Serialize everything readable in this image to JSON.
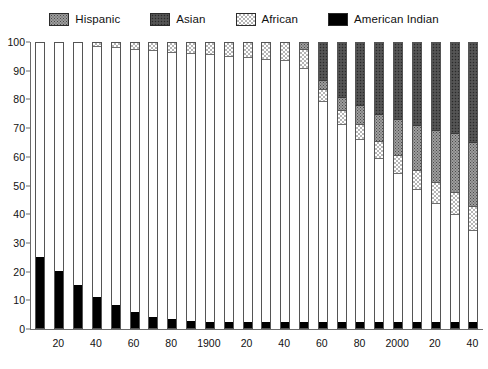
{
  "legend": {
    "items": [
      {
        "label": "Hispanic",
        "key": "hispanic",
        "color": "#9d9d9d",
        "pattern": "stipple-medium"
      },
      {
        "label": "Asian",
        "key": "asian",
        "color": "#4e4e4e",
        "pattern": "stipple-dark"
      },
      {
        "label": "African",
        "key": "african",
        "color": "#d8d8d8",
        "pattern": "checker-light"
      },
      {
        "label": "American Indian",
        "key": "amerindian",
        "color": "#000000",
        "pattern": "solid-black"
      }
    ]
  },
  "yaxis": {
    "ticks": [
      "100",
      "90",
      "80",
      "70",
      "60",
      "50",
      "40",
      "30",
      "20",
      "10",
      "0"
    ],
    "min": 0,
    "max": 100
  },
  "xaxis": {
    "labels": [
      "",
      "20",
      "",
      "40",
      "",
      "60",
      "",
      "80",
      "",
      "1900",
      "",
      "20",
      "",
      "40",
      "",
      "60",
      "",
      "80",
      "",
      "2000",
      "",
      "20",
      "",
      "40"
    ]
  },
  "chart_data": {
    "type": "bar",
    "title": "",
    "subtitle": "",
    "xlabel": "",
    "ylabel": "",
    "ylim": [
      0,
      100
    ],
    "grid": false,
    "stacked": true,
    "stack_order_bottom_to_top": [
      "amerindian",
      "white",
      "african",
      "hispanic",
      "asian"
    ],
    "legend_position": "top-center",
    "categories": [
      "1810",
      "1820",
      "1830",
      "1840",
      "1850",
      "1860",
      "1870",
      "1880",
      "1890",
      "1900",
      "1910",
      "1920",
      "1930",
      "1940",
      "1950",
      "1960",
      "1970",
      "1980",
      "1990",
      "2000",
      "2010",
      "2020",
      "2030",
      "2040"
    ],
    "x_tick_labels": [
      "",
      "20",
      "",
      "40",
      "",
      "60",
      "",
      "80",
      "",
      "1900",
      "",
      "20",
      "",
      "40",
      "",
      "60",
      "",
      "80",
      "",
      "2000",
      "",
      "20",
      "",
      "40"
    ],
    "series": [
      {
        "name": "American Indian",
        "key": "amerindian",
        "values": [
          25,
          20,
          15,
          11,
          8,
          5.5,
          4,
          3,
          2.5,
          2,
          2,
          2,
          2,
          2,
          2,
          2,
          2,
          2,
          2,
          2,
          2,
          2,
          2,
          2
        ]
      },
      {
        "name": "White / other",
        "key": "white",
        "values": [
          75,
          80,
          85,
          88,
          90.5,
          92.5,
          93.5,
          94,
          94,
          94,
          93.5,
          93,
          92.5,
          92,
          89.5,
          78,
          70,
          64.5,
          58,
          52.5,
          47,
          42,
          38,
          32.5
        ]
      },
      {
        "name": "African",
        "key": "african",
        "values": [
          0,
          0,
          0,
          1,
          1.5,
          2,
          2.5,
          3,
          3.5,
          4,
          4.5,
          5,
          5.5,
          6,
          6.5,
          4,
          4.5,
          5,
          5.5,
          6,
          6.5,
          7,
          7.5,
          8
        ]
      },
      {
        "name": "Hispanic",
        "key": "hispanic",
        "values": [
          0,
          0,
          0,
          0,
          0,
          0,
          0,
          0,
          0,
          0,
          0,
          0,
          0,
          0,
          2,
          3,
          4.5,
          6.5,
          9.5,
          12.5,
          15.5,
          18,
          20.5,
          22.5
        ]
      },
      {
        "name": "Asian",
        "key": "asian",
        "values": [
          0,
          0,
          0,
          0,
          0,
          0,
          0,
          0,
          0,
          0,
          0,
          0,
          0,
          0,
          0,
          13,
          19,
          22,
          25,
          27,
          29,
          31,
          32,
          35
        ]
      }
    ]
  }
}
